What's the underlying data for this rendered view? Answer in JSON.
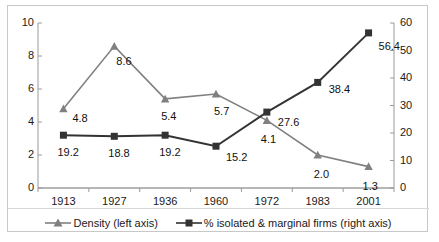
{
  "chart_data": {
    "type": "line",
    "title": "",
    "xlabel": "",
    "grid": false,
    "legend_position": "bottom",
    "categories": [
      "1913",
      "1927",
      "1936",
      "1960",
      "1972",
      "1983",
      "2001"
    ],
    "left_axis": {
      "label": "Density (left axis)",
      "ylim": [
        0,
        10
      ],
      "ticks": [
        "0",
        "2",
        "4",
        "6",
        "8",
        "10"
      ]
    },
    "right_axis": {
      "label": "% isolated & marginal firms (right axis)",
      "ylim": [
        0,
        60
      ],
      "ticks": [
        "0",
        "10",
        "20",
        "30",
        "40",
        "50",
        "60"
      ]
    },
    "series": [
      {
        "name": "Density (left axis)",
        "axis": "left",
        "marker": "triangle",
        "color": "#808080",
        "values": [
          4.8,
          8.6,
          5.4,
          5.7,
          4.1,
          2.0,
          1.3
        ],
        "labels": [
          "4.8",
          "8.6",
          "5.4",
          "5.7",
          "4.1",
          "2.0",
          "1.3"
        ]
      },
      {
        "name": "% isolated & marginal firms (right axis)",
        "axis": "right",
        "marker": "square",
        "color": "#333333",
        "values": [
          19.2,
          18.8,
          19.2,
          15.2,
          27.6,
          38.4,
          56.4
        ],
        "labels": [
          "19.2",
          "18.8",
          "19.2",
          "15.2",
          "27.6",
          "38.4",
          "56.4"
        ]
      }
    ]
  },
  "legend": {
    "items": [
      {
        "label": "Density (left axis)",
        "marker": "triangle",
        "color": "#808080"
      },
      {
        "label": "% isolated & marginal firms (right axis)",
        "marker": "square",
        "color": "#333333"
      }
    ]
  }
}
